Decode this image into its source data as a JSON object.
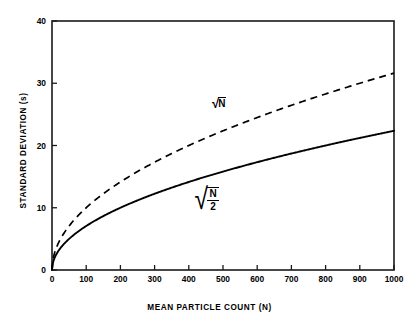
{
  "chart_data": {
    "type": "line",
    "title": "",
    "xlabel": "MEAN PARTICLE COUNT (N)",
    "ylabel": "STANDARD DEVIATION (s)",
    "xlim": [
      0,
      1000
    ],
    "ylim": [
      0,
      40
    ],
    "xticks": [
      0,
      100,
      200,
      300,
      400,
      500,
      600,
      700,
      800,
      900,
      1000
    ],
    "yticks": [
      0,
      10,
      20,
      30,
      40
    ],
    "xtick_labels": [
      "0",
      "100",
      "200",
      "300",
      "400",
      "500",
      "600",
      "700",
      "800",
      "900",
      "1000"
    ],
    "ytick_labels": [
      "0",
      "10",
      "20",
      "30",
      "40"
    ],
    "grid": false,
    "legend_position": "inline-annotations",
    "series": [
      {
        "name": "sqrt(N)",
        "style": "dashed",
        "color": "#000000",
        "annotation": "√N",
        "x": [
          0,
          10,
          25,
          50,
          75,
          100,
          150,
          200,
          250,
          300,
          350,
          400,
          450,
          500,
          550,
          600,
          650,
          700,
          750,
          800,
          850,
          900,
          950,
          1000
        ],
        "values": [
          0,
          3.16,
          5,
          7.07,
          8.66,
          10,
          12.25,
          14.14,
          15.81,
          17.32,
          18.71,
          20,
          21.21,
          22.36,
          23.45,
          24.49,
          25.5,
          26.46,
          27.39,
          28.28,
          29.15,
          30,
          30.82,
          31.62
        ]
      },
      {
        "name": "sqrt(N/2)",
        "style": "solid",
        "color": "#000000",
        "annotation": "√(N/2)",
        "x": [
          0,
          10,
          25,
          50,
          75,
          100,
          150,
          200,
          250,
          300,
          350,
          400,
          450,
          500,
          550,
          600,
          650,
          700,
          750,
          800,
          850,
          900,
          950,
          1000
        ],
        "values": [
          0,
          2.24,
          3.54,
          5,
          6.12,
          7.07,
          8.66,
          10,
          11.18,
          12.25,
          13.23,
          14.14,
          15,
          15.81,
          16.58,
          17.32,
          18.03,
          18.71,
          19.36,
          20,
          20.62,
          21.21,
          21.79,
          22.36
        ]
      }
    ],
    "annotations": [
      {
        "text": "√N",
        "symbol": "sqrt-n",
        "x": 480,
        "y": 24.5
      },
      {
        "text": "√N/2",
        "symbol": "sqrt-n-over-2",
        "numerator": "N",
        "denominator": "2",
        "x": 430,
        "y": 12.5
      }
    ]
  },
  "labels": {
    "sqrt_symbol": "√",
    "sqrt_n_radicand": "N",
    "frac_numerator": "N",
    "frac_denominator": "2"
  },
  "colors": {
    "axis": "#000000",
    "background": "#ffffff",
    "curve": "#000000"
  }
}
